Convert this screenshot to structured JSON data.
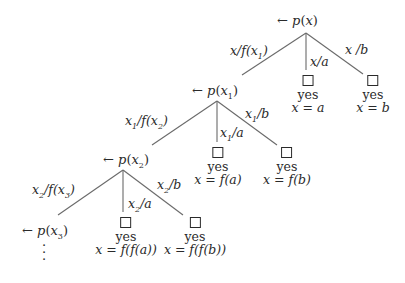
{
  "diagram": {
    "type": "proof-tree",
    "line_color": "#6a6a6a",
    "text_color": "#2a2a2a",
    "levels": [
      {
        "goal": "← p(x)",
        "goal_parts": {
          "arrow": "←",
          "pred": "p",
          "arg": "x",
          "sub": ""
        },
        "branches": {
          "recursive": {
            "edge_label": "x/f(x1)",
            "display": [
              "x/f(x",
              "1",
              ")"
            ]
          },
          "a": {
            "edge_label": "x/a",
            "display": [
              "x/a"
            ]
          },
          "b": {
            "edge_label": "x /b",
            "display": [
              "x /b"
            ]
          }
        },
        "leaves": [
          {
            "symbol": "□",
            "status": "yes",
            "binding": "x = a"
          },
          {
            "symbol": "□",
            "status": "yes",
            "binding": "x = b"
          }
        ]
      },
      {
        "goal": "← p(x1)",
        "goal_parts": {
          "arrow": "←",
          "pred": "p",
          "arg": "x",
          "sub": "1"
        },
        "branches": {
          "recursive": {
            "edge_label": "x1/f(x2)",
            "display": [
              "x",
              "1",
              "/f(x",
              "2",
              ")"
            ]
          },
          "a": {
            "edge_label": "x1/a",
            "display": [
              "x",
              "1",
              "/a"
            ]
          },
          "b": {
            "edge_label": "x1/b",
            "display": [
              "x",
              "1",
              "/b"
            ]
          }
        },
        "leaves": [
          {
            "symbol": "□",
            "status": "yes",
            "binding": "x = f(a)"
          },
          {
            "symbol": "□",
            "status": "yes",
            "binding": "x = f(b)"
          }
        ]
      },
      {
        "goal": "← p(x2)",
        "goal_parts": {
          "arrow": "←",
          "pred": "p",
          "arg": "x",
          "sub": "2"
        },
        "branches": {
          "recursive": {
            "edge_label": "x2/f(x3)",
            "display": [
              "x",
              "2",
              "/f(x",
              "3",
              ")"
            ]
          },
          "a": {
            "edge_label": "x2/a",
            "display": [
              "x",
              "2",
              "/a"
            ]
          },
          "b": {
            "edge_label": "x2/b",
            "display": [
              "x",
              "2",
              "/b"
            ]
          }
        },
        "leaves": [
          {
            "symbol": "□",
            "status": "yes",
            "binding": "x = f(f(a))"
          },
          {
            "symbol": "□",
            "status": "yes",
            "binding": "x = f(f(b))"
          }
        ]
      },
      {
        "goal": "← p(x3)",
        "goal_parts": {
          "arrow": "←",
          "pred": "p",
          "arg": "x",
          "sub": "3"
        },
        "continuation": "⋮"
      }
    ]
  }
}
